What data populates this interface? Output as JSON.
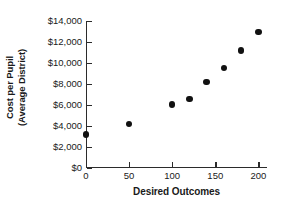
{
  "chart_data": {
    "type": "scatter",
    "title": "",
    "xlabel": "Desired Outcomes",
    "ylabel_line1": "Cost per Pupil",
    "ylabel_line2": "(Average District)",
    "ylabel": "Cost per Pupil (Average District)",
    "grid": false,
    "legend": false,
    "xlim": [
      0,
      210
    ],
    "ylim": [
      0,
      14000
    ],
    "x_ticks": [
      0,
      50,
      100,
      150,
      200
    ],
    "x_tick_labels": [
      "0",
      "50",
      "100",
      "150",
      "200"
    ],
    "y_ticks": [
      0,
      2000,
      4000,
      6000,
      8000,
      10000,
      12000,
      14000
    ],
    "y_tick_labels": [
      "$0",
      "$2,000",
      "$4,000",
      "$6,000",
      "$8,000",
      "$10,000",
      "$12,000",
      "$14,000"
    ],
    "marker": "filled-circle",
    "marker_color": "#111111",
    "axis_color": "#2b2b2b",
    "background_color": "#ffffff",
    "points": [
      {
        "x": 0,
        "y": 3200
      },
      {
        "x": 50,
        "y": 4200
      },
      {
        "x": 100,
        "y": 6050
      },
      {
        "x": 120,
        "y": 6600
      },
      {
        "x": 140,
        "y": 8200
      },
      {
        "x": 160,
        "y": 9500
      },
      {
        "x": 180,
        "y": 11200
      },
      {
        "x": 200,
        "y": 12950
      }
    ],
    "x": [
      0,
      50,
      100,
      120,
      140,
      160,
      180,
      200
    ],
    "values": [
      3200,
      4200,
      6050,
      6600,
      8200,
      9500,
      11200,
      12950
    ]
  }
}
